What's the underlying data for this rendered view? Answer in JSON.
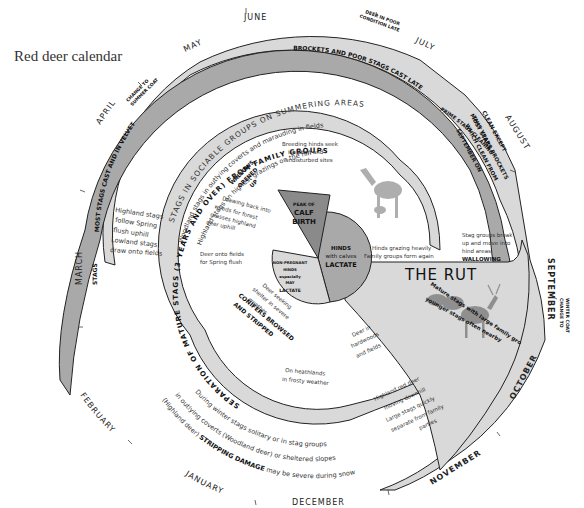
{
  "title": "Red deer calendar",
  "months": {
    "june": "JUNE",
    "july": "JULY",
    "may": "MAY",
    "april": "APRIL",
    "march": "MARCH",
    "february": "FEBRUARY",
    "january": "JANUARY",
    "december": "DECEMBER",
    "november": "NOVEMBER",
    "october": "OCTOBER",
    "september": "SEPTEMBER",
    "august": "AUGUST"
  },
  "outer_ring": {
    "change_to_summer_coat": [
      "CHANGE TO",
      "SUMMER COAT"
    ],
    "deer_poor_condition": [
      "DEER IN POOR",
      "CONDITION LATE"
    ],
    "change_to_winter_coat": [
      "CHANGE TO",
      "WINTER COAT"
    ],
    "brockets_cast_late": "BROCKETS AND POOR STAGS CAST LATE",
    "prime_stags_cleaning": "PRIME STAGS CLEANING",
    "most_stags": "MOST STAGS",
    "most_stags_cast": "MOST STAGS CAST AND IN VELVET",
    "stags": "STAGS"
  },
  "summer": {
    "heading": "STAGS IN SOCIABLE GROUPS ON SUMMERING AREAS",
    "line1": "Woodland stags in outlying coverts and marauding in fields",
    "line2": "Highland stags on highest grazings on the hill"
  },
  "cleaning": [
    "CLEAN EXCEPT",
    "THIS YEARS BROCKETS",
    "WHICH CLEAN FROM",
    "SEPTEMBER ON"
  ],
  "spring_stags": [
    "Highland stags",
    "follow Spring",
    "flush uphill",
    "Lowland stags",
    "draw onto fields"
  ],
  "inner_ring": {
    "separation": "SEPARATION OF MATURE STAGS (3 YEARS AND OVER) FROM FAMILY GROUPS"
  },
  "inner_notes": {
    "breeding_hinds": [
      "Breeding hinds seek",
      "isolation and",
      "undisturbed sites"
    ],
    "wallows": [
      "WALLOWS",
      "OPENED",
      "UP"
    ],
    "drawing_back": [
      "Drawing back into",
      "woods for forest",
      "grasses highland",
      "deer uphill"
    ],
    "deer_onto_fields": [
      "Deer onto fields",
      "for Spring flush"
    ],
    "hinds_grazing": [
      "Hinds grazing heavily",
      "Family groups form again"
    ],
    "stag_groups_break": [
      "Stag groups break",
      "up and move into",
      "hind areas"
    ],
    "wallowing": "WALLOWING",
    "deer_seeking_shelter": [
      "Deer seeking",
      "shelter in severe",
      "weather"
    ],
    "conifers": [
      "CONIFERS BROWSED",
      "AND STRIPPED"
    ],
    "deer_in_hardwoods": [
      "Deer in",
      "hardwoods",
      "and fields"
    ],
    "heathlands": [
      "On heathlands",
      "in frosty weather"
    ]
  },
  "pie": {
    "peak_calf_birth": [
      "PEAK OF",
      "CALF",
      "BIRTH"
    ],
    "hinds_lactate": [
      "HINDS",
      "with calves",
      "LACTATE"
    ],
    "non_pregnant": [
      "NON-PREGNANT",
      "HINDS",
      "especially",
      "MAY",
      "LACTATE"
    ]
  },
  "rut": {
    "title": "THE RUT",
    "line1": "Mature stags with large family groups,",
    "line2": "younger stags often nearby"
  },
  "winter": {
    "line1": "During winter stags solitary or in stag groups",
    "line2": "in outlying coverts (Woodland deer) or sheltered slopes",
    "line3_prefix": "(Highland deer)",
    "line3_bold": "STRIPPING DAMAGE",
    "line3_suffix": "may be severe during snow"
  },
  "november_notes": [
    "Highland red deer",
    "moving downhill",
    "Large stags quickly",
    "separate from family",
    "parties"
  ],
  "colors": {
    "light_band": "#d9d9d9",
    "mid_band": "#a9a9a9",
    "dark_band": "#8a8a8a",
    "ink": "#111111"
  }
}
